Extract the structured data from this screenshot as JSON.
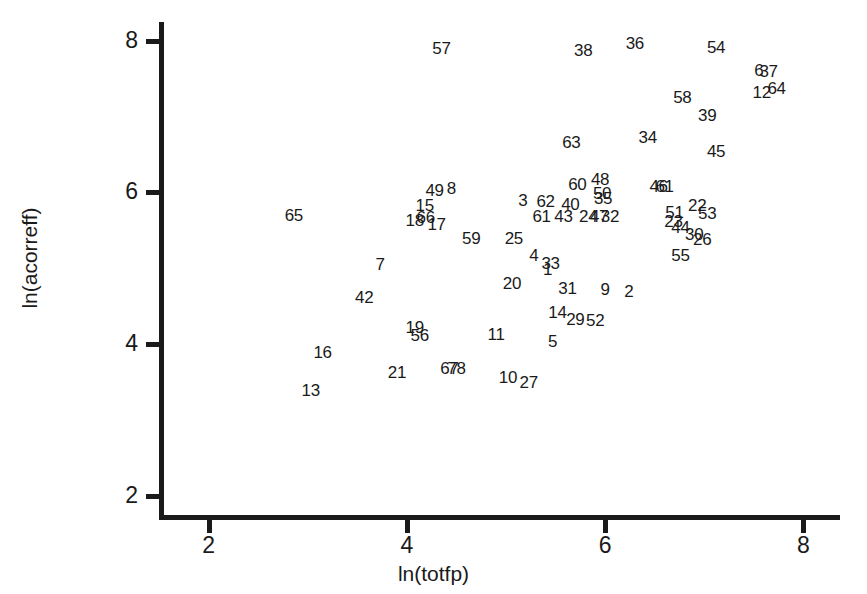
{
  "chart_data": {
    "type": "scatter",
    "title": "",
    "xlabel": "ln(totfp)",
    "ylabel": "ln(acorreff)",
    "xlim": [
      1.55,
      8.35
    ],
    "ylim": [
      1.72,
      8.22
    ],
    "xticks": [
      2,
      4,
      6,
      8
    ],
    "yticks": [
      2,
      4,
      6,
      8
    ],
    "xtick_labels": [
      "2",
      "4",
      "6",
      "8"
    ],
    "ytick_labels": [
      "2",
      "4",
      "6",
      "8"
    ],
    "grid": false,
    "legend": false,
    "marker_style": "numeric-label",
    "note": "Each data point is rendered as its observation-number label rather than a marker symbol.",
    "points": [
      {
        "label": "57",
        "x": 4.35,
        "y": 7.9
      },
      {
        "label": "38",
        "x": 5.78,
        "y": 7.88
      },
      {
        "label": "36",
        "x": 6.3,
        "y": 7.97
      },
      {
        "label": "54",
        "x": 7.12,
        "y": 7.92
      },
      {
        "label": "6",
        "x": 7.55,
        "y": 7.62
      },
      {
        "label": "37",
        "x": 7.65,
        "y": 7.6
      },
      {
        "label": "12",
        "x": 7.58,
        "y": 7.32
      },
      {
        "label": "64",
        "x": 7.73,
        "y": 7.37
      },
      {
        "label": "58",
        "x": 6.78,
        "y": 7.26
      },
      {
        "label": "39",
        "x": 7.03,
        "y": 7.02
      },
      {
        "label": "34",
        "x": 6.43,
        "y": 6.73
      },
      {
        "label": "45",
        "x": 7.12,
        "y": 6.55
      },
      {
        "label": "63",
        "x": 5.66,
        "y": 6.66
      },
      {
        "label": "48",
        "x": 5.95,
        "y": 6.17
      },
      {
        "label": "60",
        "x": 5.72,
        "y": 6.11
      },
      {
        "label": "46",
        "x": 6.54,
        "y": 6.09
      },
      {
        "label": "61",
        "x": 6.6,
        "y": 6.09
      },
      {
        "label": "49",
        "x": 4.28,
        "y": 6.03
      },
      {
        "label": "8",
        "x": 4.45,
        "y": 6.06
      },
      {
        "label": "50",
        "x": 5.97,
        "y": 5.99
      },
      {
        "label": "35",
        "x": 5.98,
        "y": 5.92
      },
      {
        "label": "3",
        "x": 5.17,
        "y": 5.9
      },
      {
        "label": "62",
        "x": 5.4,
        "y": 5.89
      },
      {
        "label": "40",
        "x": 5.65,
        "y": 5.85
      },
      {
        "label": "22",
        "x": 6.93,
        "y": 5.84
      },
      {
        "label": "15",
        "x": 4.18,
        "y": 5.83
      },
      {
        "label": "51",
        "x": 6.7,
        "y": 5.74
      },
      {
        "label": "53",
        "x": 7.03,
        "y": 5.73
      },
      {
        "label": "61b",
        "x": 5.36,
        "y": 5.69
      },
      {
        "label": "43",
        "x": 5.58,
        "y": 5.69
      },
      {
        "label": "24",
        "x": 5.83,
        "y": 5.69
      },
      {
        "label": "47",
        "x": 5.94,
        "y": 5.69
      },
      {
        "label": "32",
        "x": 6.05,
        "y": 5.69
      },
      {
        "label": "23",
        "x": 6.69,
        "y": 5.62
      },
      {
        "label": "18",
        "x": 4.08,
        "y": 5.63
      },
      {
        "label": "66",
        "x": 4.19,
        "y": 5.68
      },
      {
        "label": "17",
        "x": 4.3,
        "y": 5.58
      },
      {
        "label": "44",
        "x": 6.76,
        "y": 5.55
      },
      {
        "label": "30",
        "x": 6.9,
        "y": 5.45
      },
      {
        "label": "26",
        "x": 6.98,
        "y": 5.38
      },
      {
        "label": "59",
        "x": 4.65,
        "y": 5.4
      },
      {
        "label": "25",
        "x": 5.08,
        "y": 5.4
      },
      {
        "label": "4",
        "x": 5.28,
        "y": 5.18
      },
      {
        "label": "33",
        "x": 5.45,
        "y": 5.07
      },
      {
        "label": "1",
        "x": 5.42,
        "y": 4.99
      },
      {
        "label": "55",
        "x": 6.76,
        "y": 5.18
      },
      {
        "label": "7",
        "x": 3.73,
        "y": 5.05
      },
      {
        "label": "20",
        "x": 5.06,
        "y": 4.8
      },
      {
        "label": "31",
        "x": 5.62,
        "y": 4.74
      },
      {
        "label": "9",
        "x": 6.0,
        "y": 4.72
      },
      {
        "label": "2",
        "x": 6.24,
        "y": 4.7
      },
      {
        "label": "42",
        "x": 3.57,
        "y": 4.62
      },
      {
        "label": "14",
        "x": 5.52,
        "y": 4.42
      },
      {
        "label": "29",
        "x": 5.7,
        "y": 4.33
      },
      {
        "label": "52",
        "x": 5.9,
        "y": 4.32
      },
      {
        "label": "19",
        "x": 4.08,
        "y": 4.23
      },
      {
        "label": "56",
        "x": 4.13,
        "y": 4.12
      },
      {
        "label": "11",
        "x": 4.9,
        "y": 4.13
      },
      {
        "label": "5",
        "x": 5.47,
        "y": 4.04
      },
      {
        "label": "16",
        "x": 3.15,
        "y": 3.9
      },
      {
        "label": "67",
        "x": 4.43,
        "y": 3.68
      },
      {
        "label": "78",
        "x": 4.5,
        "y": 3.68
      },
      {
        "label": "21",
        "x": 3.9,
        "y": 3.63
      },
      {
        "label": "10",
        "x": 5.02,
        "y": 3.57
      },
      {
        "label": "27",
        "x": 5.23,
        "y": 3.5
      },
      {
        "label": "13",
        "x": 3.03,
        "y": 3.4
      },
      {
        "label": "65",
        "x": 2.86,
        "y": 5.7
      }
    ]
  },
  "axes": {
    "x_title": "ln(totfp)",
    "y_title": "ln(acorreff)",
    "x_tick_labels": [
      "2",
      "4",
      "6",
      "8"
    ],
    "y_tick_labels": [
      "2",
      "4",
      "6",
      "8"
    ]
  },
  "caption": {
    "partial_text": ""
  },
  "colors": {
    "ink": "#1a1a1a",
    "background": "#ffffff"
  }
}
